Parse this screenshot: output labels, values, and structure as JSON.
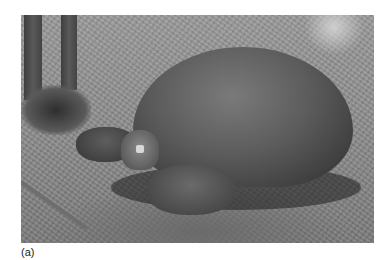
{
  "figure": {
    "photo_subject": "Giant tortoise resting on grass near tree trunks (grayscale photograph)",
    "label": "(a)"
  }
}
